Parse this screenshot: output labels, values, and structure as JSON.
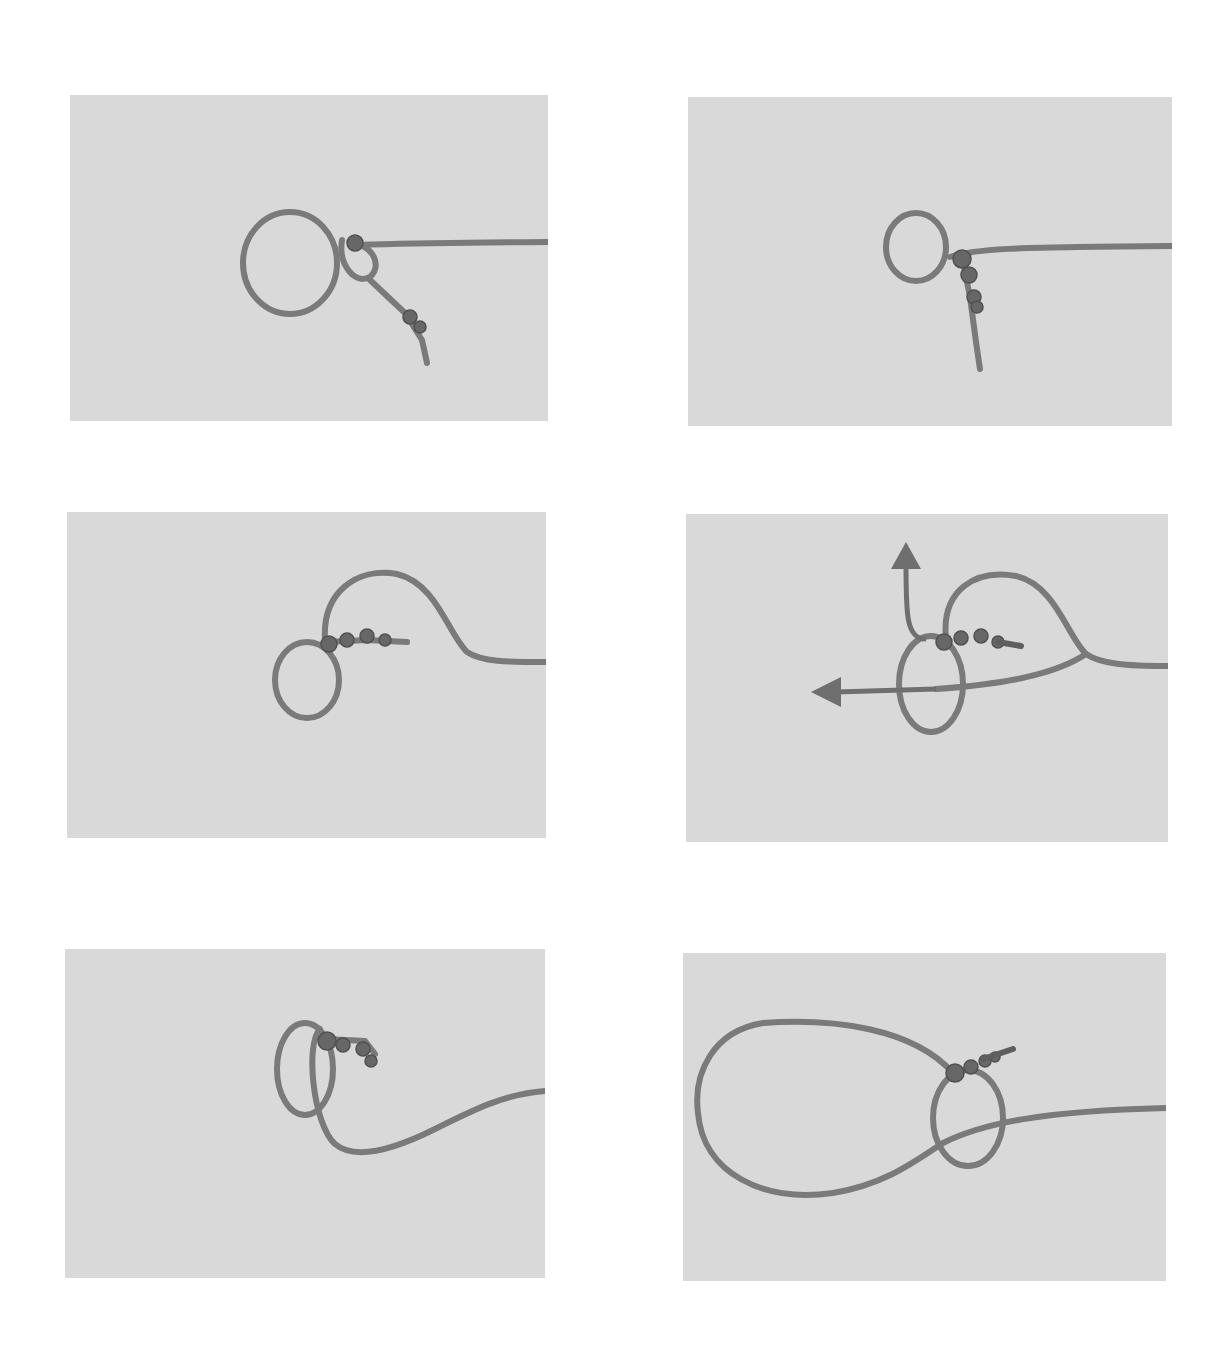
{
  "figure": {
    "background_color": "#ffffff",
    "panel_color": "#d9d9d9",
    "rope_color": "#7a7a7a",
    "panels": [
      {
        "step": 1,
        "position": "row-1-left",
        "content": "loop with knot at junction, standing part to the right, tail hanging down"
      },
      {
        "step": 2,
        "position": "row-1-right",
        "content": "small loop tightened with knot, tail hanging down"
      },
      {
        "step": 3,
        "position": "row-2-left",
        "content": "loop with standing part curving up and to the right"
      },
      {
        "step": 4,
        "position": "row-2-right",
        "content": "loop with arrows indicating pull directions",
        "arrows": [
          "up",
          "left"
        ]
      },
      {
        "step": 5,
        "position": "row-3-left",
        "content": "double loop with tail curving right"
      },
      {
        "step": 6,
        "position": "row-3-right",
        "content": "large finished loop with knot"
      }
    ]
  }
}
